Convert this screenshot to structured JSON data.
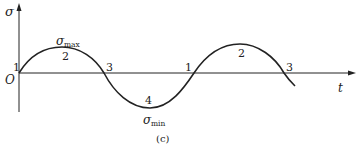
{
  "diagram": {
    "caption": "(c)",
    "y_axis_label": "σ",
    "x_axis_label": "t",
    "origin_label": "O",
    "sigma_max_symbol": "σ",
    "sigma_max_sub": "max",
    "sigma_min_symbol": "σ",
    "sigma_min_sub": "min",
    "points": [
      {
        "label": "1",
        "desc": "zero crossing (start)"
      },
      {
        "label": "2",
        "desc": "maximum"
      },
      {
        "label": "3",
        "desc": "zero crossing"
      },
      {
        "label": "4",
        "desc": "minimum"
      },
      {
        "label": "1",
        "desc": "zero crossing"
      },
      {
        "label": "2",
        "desc": "maximum"
      },
      {
        "label": "3",
        "desc": "zero crossing"
      }
    ],
    "colors": {
      "line": "#222222",
      "background": "#ffffff"
    }
  }
}
